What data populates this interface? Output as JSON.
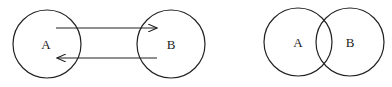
{
  "diagram_left": {
    "nodes": [
      {
        "id": "A",
        "label": "A"
      },
      {
        "id": "B",
        "label": "B"
      }
    ],
    "edges": [
      {
        "from": "A",
        "to": "B",
        "direction": "right"
      },
      {
        "from": "B",
        "to": "A",
        "direction": "left"
      }
    ]
  },
  "diagram_right": {
    "type": "venn",
    "sets": [
      {
        "id": "A",
        "label": "A"
      },
      {
        "id": "B",
        "label": "B"
      }
    ]
  },
  "colors": {
    "stroke": "#222222",
    "background": "#ffffff"
  }
}
